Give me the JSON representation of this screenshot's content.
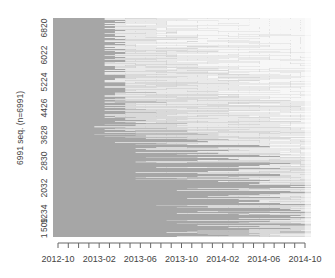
{
  "chart_data": {
    "type": "heatmap",
    "subtype": "sequence-index-plot",
    "title": "",
    "xlabel": "",
    "ylabel": "6991 seq. (n=6991)",
    "n_sequences": 6991,
    "y_ticks": [
      "1",
      "509",
      "1234",
      "2032",
      "2830",
      "3628",
      "4426",
      "5224",
      "6022",
      "6820"
    ],
    "y_tick_values": [
      1,
      509,
      1234,
      2032,
      2830,
      3628,
      4426,
      5224,
      6022,
      6820
    ],
    "x_tick_labels": [
      "2012-10",
      "2013-02",
      "2013-06",
      "2013-10",
      "2014-02",
      "2014-06",
      "2014-10"
    ],
    "x_range": [
      "2012-10",
      "2014-10"
    ],
    "n_months": 25,
    "grid": false,
    "legend": "none",
    "state_colors": {
      "dark": "#a6a6a6",
      "medium": "#bdbdbd",
      "light": "#d9d9d9",
      "lighter": "#e9e9e9",
      "empty": "#f7f7f7"
    }
  }
}
